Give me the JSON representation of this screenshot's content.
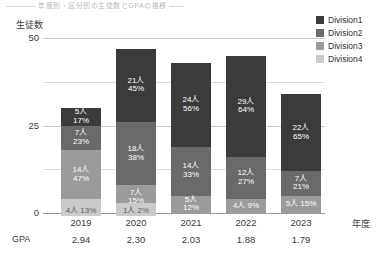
{
  "top_note": "―――― 年度別・区分別の生徒数とGPAの推移 ――",
  "axes": {
    "y_title": "生徒数",
    "y_ticks": [
      "0",
      "25",
      "50"
    ],
    "x_title": "年度",
    "gpa_row_title": "GPA"
  },
  "legend": {
    "items": [
      {
        "label": "Division1",
        "color": "#3b3b3b"
      },
      {
        "label": "Division2",
        "color": "#6a6a6a"
      },
      {
        "label": "Division3",
        "color": "#9b9b9b"
      },
      {
        "label": "Division4",
        "color": "#cacaca"
      }
    ]
  },
  "chart_data": {
    "type": "bar",
    "stacked": true,
    "title": "",
    "xlabel": "年度",
    "ylabel": "生徒数",
    "ylim": [
      0,
      50
    ],
    "yticks": [
      0,
      25,
      50
    ],
    "minor_gridlines": [
      12.5,
      37.5
    ],
    "grid": true,
    "legend_position": "top-right",
    "categories": [
      "2019",
      "2020",
      "2021",
      "2022",
      "2023"
    ],
    "gpa": [
      "2.94",
      "2.30",
      "2.03",
      "1.88",
      "1.79"
    ],
    "totals": [
      30,
      47,
      43,
      45,
      34
    ],
    "series": [
      {
        "name": "Division1",
        "color": "#3b3b3b",
        "values": [
          5,
          21,
          24,
          29,
          22
        ],
        "percents": [
          "17%",
          "45%",
          "56%",
          "64%",
          "65%"
        ],
        "labels": [
          "5人",
          "21人",
          "24人",
          "29人",
          "22人"
        ]
      },
      {
        "name": "Division2",
        "color": "#6a6a6a",
        "values": [
          7,
          18,
          14,
          12,
          7
        ],
        "percents": [
          "23%",
          "38%",
          "33%",
          "27%",
          "21%"
        ],
        "labels": [
          "7人",
          "18人",
          "14人",
          "12人",
          "7人"
        ]
      },
      {
        "name": "Division3",
        "color": "#9b9b9b",
        "values": [
          14,
          7,
          5,
          4,
          5
        ],
        "percents": [
          "47%",
          "15%",
          "12%",
          "9%",
          "15%"
        ],
        "labels": [
          "14人",
          "7人",
          "5人",
          "4人",
          "5人"
        ]
      },
      {
        "name": "Division4",
        "color": "#cacaca",
        "values": [
          4,
          1,
          0,
          0,
          0
        ],
        "percents": [
          "13%",
          "2%",
          "",
          "",
          ""
        ],
        "labels": [
          "4人 13%",
          "1人 2%",
          "",
          "",
          ""
        ]
      }
    ]
  },
  "bars": [
    {
      "year": "2019",
      "gpa": "2.94",
      "segments": [
        {
          "div": "Division1",
          "count": "5人",
          "pct": "17%"
        },
        {
          "div": "Division2",
          "count": "7人",
          "pct": "23%"
        },
        {
          "div": "Division3",
          "count": "14人",
          "pct": "47%"
        }
      ],
      "bottom_label": "4人 13%"
    },
    {
      "year": "2020",
      "gpa": "2.30",
      "segments": [
        {
          "div": "Division1",
          "count": "21人",
          "pct": "45%"
        },
        {
          "div": "Division2",
          "count": "18人",
          "pct": "38%"
        },
        {
          "div": "Division3",
          "count": "7人",
          "pct": "15%"
        }
      ],
      "bottom_label": "1人 2%"
    },
    {
      "year": "2021",
      "gpa": "2.03",
      "segments": [
        {
          "div": "Division1",
          "count": "24人",
          "pct": "56%"
        },
        {
          "div": "Division2",
          "count": "14人",
          "pct": "33%"
        },
        {
          "div": "Division3",
          "count": "5人",
          "pct": "12%"
        }
      ],
      "bottom_label": ""
    },
    {
      "year": "2022",
      "gpa": "1.88",
      "segments": [
        {
          "div": "Division1",
          "count": "29人",
          "pct": "64%"
        },
        {
          "div": "Division2",
          "count": "12人",
          "pct": "27%"
        },
        {
          "div": "Division3",
          "count": "4人 9%",
          "pct": ""
        }
      ],
      "bottom_label": ""
    },
    {
      "year": "2023",
      "gpa": "1.79",
      "segments": [
        {
          "div": "Division1",
          "count": "22人",
          "pct": "65%"
        },
        {
          "div": "Division2",
          "count": "7人",
          "pct": "21%"
        },
        {
          "div": "Division3",
          "count": "5人 15%",
          "pct": ""
        }
      ],
      "bottom_label": ""
    }
  ]
}
